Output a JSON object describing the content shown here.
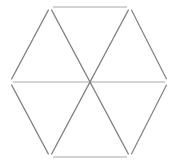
{
  "figure": {
    "shape_name": "hexagon",
    "orientation": "flat-top",
    "background_color": "#ffffff",
    "canvas": {
      "width": 177,
      "height": 165
    },
    "style": {
      "stroke_color_diagonal": "#808080",
      "stroke_color_horizontal": "#a8a8a8",
      "stroke_width": 1.2,
      "vertex_gap_px": 3,
      "rendering": "matchstick-segments"
    },
    "vertices": [
      {
        "name": "top-left",
        "x": 50,
        "y": 7
      },
      {
        "name": "top-right",
        "x": 130,
        "y": 7
      },
      {
        "name": "right",
        "x": 168,
        "y": 82
      },
      {
        "name": "bottom-right",
        "x": 130,
        "y": 157
      },
      {
        "name": "bottom-left",
        "x": 50,
        "y": 157
      },
      {
        "name": "left",
        "x": 10,
        "y": 82
      }
    ],
    "center": {
      "name": "center",
      "x": 89,
      "y": 82
    },
    "segments": [
      {
        "name": "edge-top",
        "kind": "perimeter",
        "from": "top-left",
        "to": "top-right",
        "x1": 50,
        "y1": 7,
        "x2": 130,
        "y2": 7,
        "color": "#a8a8a8"
      },
      {
        "name": "edge-upper-right",
        "kind": "perimeter",
        "from": "top-right",
        "to": "right",
        "x1": 130,
        "y1": 7,
        "x2": 168,
        "y2": 82,
        "color": "#808080"
      },
      {
        "name": "edge-lower-right",
        "kind": "perimeter",
        "from": "right",
        "to": "bottom-right",
        "x1": 168,
        "y1": 82,
        "x2": 130,
        "y2": 157,
        "color": "#808080"
      },
      {
        "name": "edge-bottom",
        "kind": "perimeter",
        "from": "bottom-right",
        "to": "bottom-left",
        "x1": 130,
        "y1": 157,
        "x2": 50,
        "y2": 157,
        "color": "#a8a8a8"
      },
      {
        "name": "edge-lower-left",
        "kind": "perimeter",
        "from": "bottom-left",
        "to": "left",
        "x1": 50,
        "y1": 157,
        "x2": 10,
        "y2": 82,
        "color": "#808080"
      },
      {
        "name": "edge-upper-left",
        "kind": "perimeter",
        "from": "left",
        "to": "top-left",
        "x1": 10,
        "y1": 82,
        "x2": 50,
        "y2": 7,
        "color": "#808080"
      },
      {
        "name": "diagonal-horizontal",
        "kind": "diameter",
        "from": "left",
        "to": "right",
        "x1": 10,
        "y1": 82,
        "x2": 168,
        "y2": 82,
        "color": "#a8a8a8"
      },
      {
        "name": "diagonal-tl-br",
        "kind": "diameter",
        "from": "top-left",
        "to": "bottom-right",
        "x1": 50,
        "y1": 7,
        "x2": 130,
        "y2": 157,
        "color": "#808080"
      },
      {
        "name": "diagonal-tr-bl",
        "kind": "diameter",
        "from": "top-right",
        "to": "bottom-left",
        "x1": 130,
        "y1": 7,
        "x2": 50,
        "y2": 157,
        "color": "#808080"
      }
    ],
    "triangle_count": 6,
    "segment_count": 9
  }
}
